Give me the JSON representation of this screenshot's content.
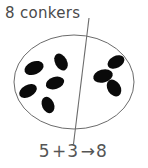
{
  "title": {
    "count": "8",
    "noun": "conkers",
    "text": "8 conkers"
  },
  "diagram": {
    "container_shape": "ellipse",
    "container_stroke": "#6b6b6b",
    "divider_label": "partition-line",
    "divider_stroke": "#6b6b6b",
    "object_name": "conker",
    "object_color": "#0a0a0a",
    "left_group_count": 5,
    "right_group_count": 3,
    "total_count": 8,
    "left_group_objects": [
      {
        "cx": 34,
        "cy": 68,
        "rx": 10,
        "ry": 6.5,
        "rot": -22
      },
      {
        "cx": 61,
        "cy": 62,
        "rx": 9,
        "ry": 6,
        "rot": 62
      },
      {
        "cx": 55,
        "cy": 83,
        "rx": 9.5,
        "ry": 6,
        "rot": -18
      },
      {
        "cx": 28,
        "cy": 91,
        "rx": 9.5,
        "ry": 6,
        "rot": -28
      },
      {
        "cx": 48,
        "cy": 105,
        "rx": 8.5,
        "ry": 6,
        "rot": 66
      }
    ],
    "right_group_objects": [
      {
        "cx": 116,
        "cy": 62,
        "rx": 9,
        "ry": 6,
        "rot": -28
      },
      {
        "cx": 103,
        "cy": 76,
        "rx": 10,
        "ry": 6.5,
        "rot": -16
      },
      {
        "cx": 114,
        "cy": 88,
        "rx": 9,
        "ry": 6.5,
        "rot": 58
      }
    ]
  },
  "equation": {
    "addend_1": "5",
    "operator": "+",
    "addend_2": "3",
    "arrow": "→",
    "sum": "8",
    "text": "5 + 3 → 8"
  }
}
